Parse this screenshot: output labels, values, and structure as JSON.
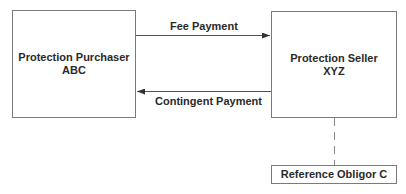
{
  "diagram": {
    "nodes": {
      "purchaser": {
        "line1": "Protection Purchaser",
        "line2": "ABC"
      },
      "seller": {
        "line1": "Protection Seller",
        "line2": "XYZ"
      },
      "reference": {
        "label": "Reference Obligor C"
      }
    },
    "edges": {
      "fee": {
        "label": "Fee Payment",
        "from": "Protection Purchaser ABC",
        "to": "Protection Seller XYZ"
      },
      "contingent": {
        "label": "Contingent Payment",
        "from": "Protection Seller XYZ",
        "to": "Protection Purchaser ABC"
      },
      "reference_link": {
        "style": "dashed",
        "from": "Protection Seller XYZ",
        "to": "Reference Obligor C"
      }
    },
    "colors": {
      "line": "#555555",
      "border": "#7a7a7a",
      "text": "#2a2a2a"
    }
  }
}
